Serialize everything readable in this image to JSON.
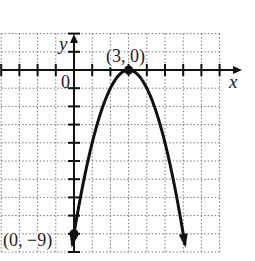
{
  "chart_data": {
    "type": "line",
    "title": "",
    "xlabel": "x",
    "ylabel": "y",
    "origin_label": "0",
    "function": "y = -(x - 3)^2",
    "xlim": [
      -4,
      8
    ],
    "ylim": [
      -10,
      2
    ],
    "grid": true,
    "grid_style": "dotted",
    "x": [
      -0.1,
      0,
      1,
      2,
      3,
      4,
      5,
      6,
      6.1
    ],
    "y": [
      -9.61,
      -9,
      -4,
      -1,
      0,
      -1,
      -4,
      -9,
      -9.61
    ],
    "annotations": [
      {
        "label": "(3, 0)",
        "x": 3,
        "y": 0,
        "marker": "dot"
      },
      {
        "label": "(0, −9)",
        "x": 0,
        "y": -9,
        "marker": "dot"
      }
    ],
    "legend": null
  },
  "labels": {
    "y_axis": "y",
    "x_axis": "x",
    "origin": "0",
    "vertex": "(3, 0)",
    "intercept": "(0, −9)"
  }
}
